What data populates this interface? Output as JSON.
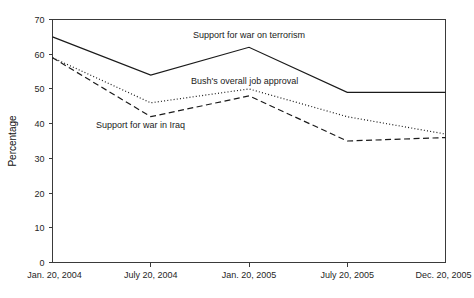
{
  "chart_data": {
    "type": "line",
    "title": "",
    "xlabel": "",
    "ylabel": "Percentage",
    "ylim": [
      0,
      70
    ],
    "ytick_step": 10,
    "grid": false,
    "legend_position": "inline-annotations",
    "categories": [
      "Jan. 20, 2004",
      "July 20, 2004",
      "Jan. 20, 2005",
      "July 20, 2005",
      "Dec. 20, 2005"
    ],
    "yticks": [
      "0",
      "10",
      "20",
      "30",
      "40",
      "50",
      "60",
      "70"
    ],
    "series": [
      {
        "name": "Support for war on terrorism",
        "style": "solid",
        "values": [
          65,
          54,
          62,
          49,
          49
        ]
      },
      {
        "name": "Bush's overall job approval",
        "style": "dotted",
        "values": [
          59,
          46,
          50,
          42,
          37
        ]
      },
      {
        "name": "Support for war in Iraq",
        "style": "dashed",
        "values": [
          59,
          42,
          48,
          35,
          36
        ]
      }
    ],
    "annotations": [
      {
        "text": "Support for war on terrorism",
        "x_px": 193,
        "y_px": 38
      },
      {
        "text": "Bush's overall job approval",
        "x_px": 191,
        "y_px": 84
      },
      {
        "text": "Support for war in Iraq",
        "x_px": 96,
        "y_px": 128
      }
    ]
  },
  "axes": {
    "y_axis_title": "Percentage"
  }
}
